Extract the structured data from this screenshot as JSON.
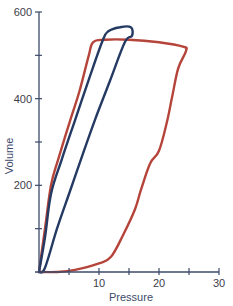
{
  "chart_data": {
    "type": "line",
    "title": "",
    "xlabel": "Pressure",
    "ylabel": "Volume",
    "xlim": [
      0,
      30
    ],
    "ylim": [
      0,
      600
    ],
    "x_major_ticks": [
      10,
      20,
      30
    ],
    "x_minor_ticks": [
      5,
      15,
      25
    ],
    "y_major_ticks": [
      200,
      400,
      600
    ],
    "y_minor_ticks": [
      100,
      300,
      500
    ],
    "x_tick_labels": [
      "10",
      "20",
      "30"
    ],
    "y_tick_labels": [
      "200",
      "400",
      "600"
    ],
    "grid": false,
    "legend": "none",
    "series": [
      {
        "name": "loop-red",
        "color": "#b5443a",
        "closed": true,
        "points": [
          [
            0,
            0
          ],
          [
            3,
            0
          ],
          [
            6,
            5
          ],
          [
            10,
            20
          ],
          [
            12,
            35
          ],
          [
            14,
            85
          ],
          [
            16,
            145
          ],
          [
            17,
            190
          ],
          [
            18.5,
            250
          ],
          [
            20,
            280
          ],
          [
            21.3,
            345
          ],
          [
            22.2,
            405
          ],
          [
            23.2,
            470
          ],
          [
            24.5,
            510
          ],
          [
            24,
            520
          ],
          [
            20,
            530
          ],
          [
            15,
            536
          ],
          [
            11,
            536
          ],
          [
            9,
            530
          ],
          [
            8.3,
            500
          ],
          [
            6.8,
            420
          ],
          [
            5.2,
            350
          ],
          [
            3.2,
            260
          ],
          [
            2,
            200
          ],
          [
            1,
            100
          ],
          [
            0,
            0
          ]
        ]
      },
      {
        "name": "loop-blue",
        "color": "#253a63",
        "closed": true,
        "points": [
          [
            0,
            0
          ],
          [
            1,
            80
          ],
          [
            2,
            180
          ],
          [
            3.8,
            260
          ],
          [
            6,
            350
          ],
          [
            8.2,
            440
          ],
          [
            10.5,
            530
          ],
          [
            11.5,
            555
          ],
          [
            13.5,
            565
          ],
          [
            15.3,
            565
          ],
          [
            15.5,
            545
          ],
          [
            14.3,
            530
          ],
          [
            11.8,
            440
          ],
          [
            9.3,
            350
          ],
          [
            7.5,
            280
          ],
          [
            5,
            180
          ],
          [
            3,
            100
          ],
          [
            1,
            10
          ],
          [
            0,
            0
          ]
        ]
      }
    ]
  }
}
